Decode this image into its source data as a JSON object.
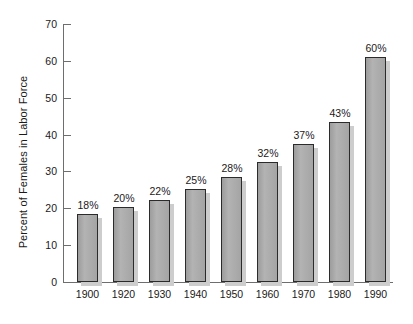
{
  "chart_data": {
    "type": "bar",
    "title": "",
    "subtitle": "",
    "xlabel": "",
    "ylabel": "Percent of Females in Labor Force",
    "categories": [
      "1900",
      "1920",
      "1930",
      "1940",
      "1950",
      "1960",
      "1970",
      "1980",
      "1990"
    ],
    "values": [
      18,
      20,
      22,
      25,
      28,
      32,
      37,
      43,
      60
    ],
    "data_labels": [
      "18%",
      "20%",
      "22%",
      "25%",
      "28%",
      "32%",
      "37%",
      "43%",
      "60%"
    ],
    "bar_plot_heights": [
      18.5,
      20.3,
      22.3,
      25.3,
      28.5,
      32.5,
      37.5,
      43.5,
      61.0
    ],
    "ylim": [
      0,
      70
    ],
    "yticks": [
      0,
      10,
      20,
      30,
      40,
      50,
      60,
      70
    ],
    "ytick_labels": [
      "0",
      "10",
      "20",
      "30",
      "40",
      "50",
      "60",
      "70"
    ],
    "grid": false,
    "legend": null,
    "legend_position": "none",
    "colors": {
      "bar_fill": "#a9a9a9",
      "bar_edge": "#2b2b2b",
      "bar_shadow": "#cdcdcd",
      "axis": "#6e6e6e",
      "text": "#1a1a1a",
      "background": "#ffffff"
    }
  }
}
